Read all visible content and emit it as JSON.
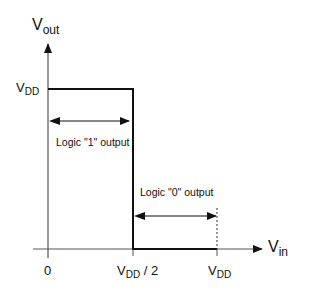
{
  "diagram": {
    "y_axis": {
      "label_main": "V",
      "label_sub": "out"
    },
    "x_axis": {
      "label_main": "V",
      "label_sub": "in"
    },
    "y_ticks": [
      {
        "main": "V",
        "sub": "DD",
        "suffix": ""
      }
    ],
    "x_ticks": [
      {
        "main": "0",
        "sub": "",
        "suffix": ""
      },
      {
        "main": "V",
        "sub": "DD",
        "suffix": " / 2"
      },
      {
        "main": "V",
        "sub": "DD",
        "suffix": ""
      }
    ],
    "annotations": {
      "logic1": "Logic \"1\" output",
      "logic0": "Logic \"0\" output"
    },
    "colors": {
      "line": "#111111",
      "background": "#ffffff"
    }
  }
}
